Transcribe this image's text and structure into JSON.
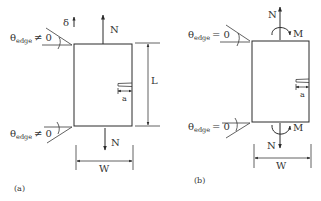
{
  "figure": {
    "panel_a": {
      "caption": "(a)",
      "top_force_label": "N",
      "bottom_force_label": "N",
      "displacement_label": "δ",
      "length_label": "L",
      "width_label": "W",
      "crack_label": "a",
      "top_angle": {
        "theta": "θ",
        "sub": "edge",
        "relation": "≠ 0"
      },
      "bottom_angle": {
        "theta": "θ",
        "sub": "edge",
        "relation": "≠ 0"
      }
    },
    "panel_b": {
      "caption": "(b)",
      "top_force_label": "N",
      "bottom_force_label": "N",
      "top_moment_label": "M",
      "bottom_moment_label": "M",
      "width_label": "W",
      "crack_label": "a",
      "top_angle": {
        "theta": "θ",
        "sub": "edge",
        "relation": "= 0"
      },
      "bottom_angle": {
        "theta": "θ",
        "sub": "edge",
        "relation": "= 0"
      }
    }
  },
  "colors": {
    "line": "#2a2a2a",
    "background": "#ffffff"
  }
}
